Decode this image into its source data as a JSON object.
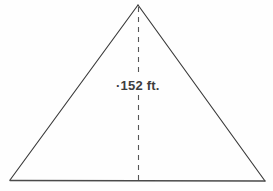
{
  "figure": {
    "type": "triangle-with-altitude",
    "shape_name": "isosceles-triangle",
    "background_color": "#fefefe",
    "stroke_color": "#3a3a3a",
    "dash_color": "#555555",
    "text_color": "#3d3d3d",
    "apex": {
      "x": 138,
      "y": 5
    },
    "base_left": {
      "x": 10,
      "y": 180
    },
    "base_right": {
      "x": 265,
      "y": 181
    },
    "altitude": {
      "label": "·152 ft.",
      "value": "152",
      "unit": "ft.",
      "from": {
        "x": 138,
        "y": 5
      },
      "to": {
        "x": 138,
        "y": 180
      },
      "dash_pattern": "5,5"
    }
  }
}
